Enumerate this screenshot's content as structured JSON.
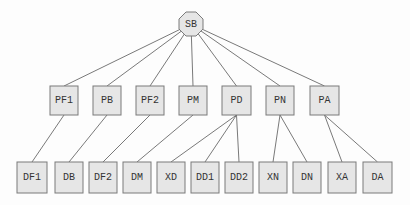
{
  "diagram": {
    "type": "tree",
    "root": {
      "id": "SB",
      "label": "SB",
      "shape": "octagon",
      "cx": 191,
      "cy": 24,
      "r": 13
    },
    "level1": [
      {
        "id": "PF1",
        "label": "PF1",
        "x": 50,
        "y": 86,
        "w": 28,
        "h": 29
      },
      {
        "id": "PB",
        "label": "PB",
        "x": 93,
        "y": 86,
        "w": 28,
        "h": 29
      },
      {
        "id": "PF2",
        "label": "PF2",
        "x": 136,
        "y": 86,
        "w": 28,
        "h": 29
      },
      {
        "id": "PM",
        "label": "PM",
        "x": 179,
        "y": 86,
        "w": 28,
        "h": 29
      },
      {
        "id": "PD",
        "label": "PD",
        "x": 222,
        "y": 86,
        "w": 29,
        "h": 29
      },
      {
        "id": "PN",
        "label": "PN",
        "x": 266,
        "y": 86,
        "w": 28,
        "h": 29
      },
      {
        "id": "PA",
        "label": "PA",
        "x": 310,
        "y": 86,
        "w": 29,
        "h": 29
      }
    ],
    "level2": [
      {
        "id": "DF1",
        "label": "DF1",
        "parent": "PF1",
        "x": 17,
        "y": 162,
        "w": 30,
        "h": 31
      },
      {
        "id": "DB",
        "label": "DB",
        "parent": "PB",
        "x": 55,
        "y": 162,
        "w": 28,
        "h": 31
      },
      {
        "id": "DF2",
        "label": "DF2",
        "parent": "PF2",
        "x": 89,
        "y": 162,
        "w": 28,
        "h": 31
      },
      {
        "id": "DM",
        "label": "DM",
        "parent": "PM",
        "x": 123,
        "y": 162,
        "w": 28,
        "h": 31
      },
      {
        "id": "XD",
        "label": "XD",
        "parent": "PD",
        "x": 157,
        "y": 162,
        "w": 28,
        "h": 31
      },
      {
        "id": "DD1",
        "label": "DD1",
        "parent": "PD",
        "x": 191,
        "y": 162,
        "w": 28,
        "h": 31
      },
      {
        "id": "DD2",
        "label": "DD2",
        "parent": "PD",
        "x": 225,
        "y": 162,
        "w": 28,
        "h": 31
      },
      {
        "id": "XN",
        "label": "XN",
        "parent": "PN",
        "x": 259,
        "y": 162,
        "w": 28,
        "h": 31
      },
      {
        "id": "DN",
        "label": "DN",
        "parent": "PN",
        "x": 293,
        "y": 162,
        "w": 28,
        "h": 31
      },
      {
        "id": "XA",
        "label": "XA",
        "parent": "PA",
        "x": 328,
        "y": 162,
        "w": 28,
        "h": 31
      },
      {
        "id": "DA",
        "label": "DA",
        "parent": "PA",
        "x": 363,
        "y": 162,
        "w": 29,
        "h": 31
      }
    ],
    "colors": {
      "fill": "#e6e6e6",
      "stroke": "#7a7a7a",
      "edge": "#6a6a6a",
      "text": "#333333"
    }
  }
}
